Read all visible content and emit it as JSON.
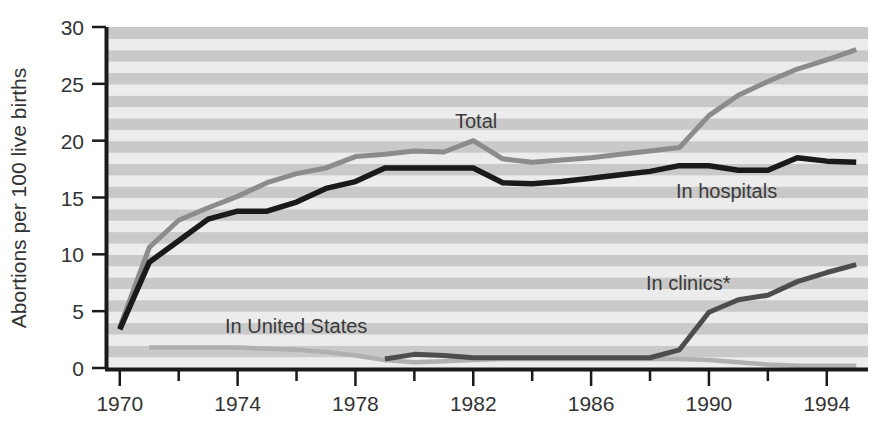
{
  "chart_data": {
    "type": "line",
    "title": "",
    "xlabel": "",
    "ylabel": "Abortions per 100 live births",
    "xlim": [
      1969.6,
      1995.4
    ],
    "ylim": [
      0,
      30
    ],
    "y_ticks": [
      0,
      5,
      10,
      15,
      20,
      25,
      30
    ],
    "x_ticks": [
      1970,
      1974,
      1978,
      1982,
      1986,
      1990,
      1994
    ],
    "x_minor_ticks": [
      1972,
      1976,
      1980,
      1984,
      1988,
      1992
    ],
    "grid": "horizontal-alternating-bands",
    "legend_position": "inline-annotations",
    "footnote_marker": "*",
    "series": [
      {
        "name": "Total",
        "color": "#8c8c8c",
        "label": "Total",
        "x": [
          1970,
          1971,
          1972,
          1973,
          1974,
          1975,
          1976,
          1977,
          1978,
          1979,
          1980,
          1981,
          1982,
          1983,
          1984,
          1985,
          1986,
          1987,
          1988,
          1989,
          1990,
          1991,
          1992,
          1993,
          1994,
          1995
        ],
        "values": [
          3.6,
          10.6,
          13.0,
          14.1,
          15.1,
          16.3,
          17.1,
          17.6,
          18.6,
          18.8,
          19.1,
          19.0,
          20.0,
          18.4,
          18.1,
          18.3,
          18.5,
          18.8,
          19.1,
          19.4,
          22.2,
          24.0,
          25.2,
          26.3,
          27.1,
          28.0
        ]
      },
      {
        "name": "In hospitals",
        "color": "#1a1a1a",
        "label": "In hospitals",
        "x": [
          1970,
          1971,
          1972,
          1973,
          1974,
          1975,
          1976,
          1977,
          1978,
          1979,
          1980,
          1981,
          1982,
          1983,
          1984,
          1985,
          1986,
          1987,
          1988,
          1989,
          1990,
          1991,
          1992,
          1993,
          1994,
          1995
        ],
        "values": [
          3.4,
          9.3,
          11.2,
          13.1,
          13.8,
          13.8,
          14.6,
          15.8,
          16.4,
          17.6,
          17.6,
          17.6,
          17.6,
          16.3,
          16.2,
          16.4,
          16.7,
          17.0,
          17.3,
          17.8,
          17.8,
          17.4,
          17.4,
          18.5,
          18.2,
          18.1
        ]
      },
      {
        "name": "In clinics*",
        "color": "#4d4d4d",
        "label": "In clinics*",
        "x": [
          1979,
          1980,
          1981,
          1982,
          1983,
          1984,
          1985,
          1986,
          1987,
          1988,
          1989,
          1990,
          1991,
          1992,
          1993,
          1994,
          1995
        ],
        "values": [
          0.8,
          1.2,
          1.1,
          0.9,
          0.9,
          0.9,
          0.9,
          0.9,
          0.9,
          0.9,
          1.6,
          4.9,
          6.0,
          6.4,
          7.6,
          8.4,
          9.1
        ]
      },
      {
        "name": "In United States",
        "color": "#b0b0b0",
        "label": "In United States",
        "x": [
          1971,
          1972,
          1973,
          1974,
          1975,
          1976,
          1977,
          1978,
          1979,
          1980,
          1981,
          1982,
          1983,
          1984,
          1985,
          1986,
          1987,
          1988,
          1989,
          1990,
          1991,
          1992,
          1993,
          1994,
          1995
        ],
        "values": [
          1.8,
          1.8,
          1.8,
          1.8,
          1.7,
          1.6,
          1.4,
          1.1,
          0.7,
          0.5,
          0.6,
          0.7,
          0.8,
          0.8,
          0.8,
          0.8,
          0.8,
          0.8,
          0.8,
          0.7,
          0.5,
          0.3,
          0.2,
          0.2,
          0.2
        ]
      }
    ]
  },
  "axes": {
    "y_title": "Abortions per 100 live births",
    "y_tick_labels": [
      "0",
      "5",
      "10",
      "15",
      "20",
      "25",
      "30"
    ],
    "x_tick_labels": [
      "1970",
      "1974",
      "1978",
      "1982",
      "1986",
      "1990",
      "1994"
    ]
  },
  "annotations": {
    "total": "Total",
    "in_hospitals": "In hospitals",
    "in_clinics": "In clinics*",
    "in_united_states": "In United States"
  },
  "colors": {
    "band_dark": "#c9c9c9",
    "band_light": "#ececec",
    "axis": "#1a1a1a",
    "total": "#8c8c8c",
    "hospitals": "#1a1a1a",
    "clinics": "#4d4d4d",
    "united_states": "#b0b0b0"
  }
}
